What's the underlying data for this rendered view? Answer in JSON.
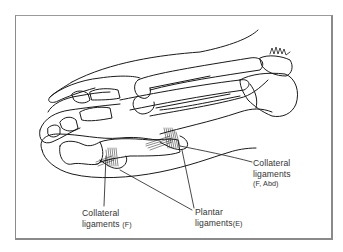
{
  "figure": {
    "style": "black line drawing",
    "frame_color": "#8a8a8a",
    "line_color": "#1a1a1a"
  },
  "labels": {
    "collateral_f_abd": {
      "line1": "Collateral",
      "line2": "ligaments",
      "line3": "(F, Abd)"
    },
    "collateral_f": {
      "line1": "Collateral",
      "line2": "ligaments",
      "suffix": "(F)"
    },
    "plantar_e": {
      "line1": "Plantar",
      "line2": "ligaments",
      "suffix": "(E)"
    }
  }
}
